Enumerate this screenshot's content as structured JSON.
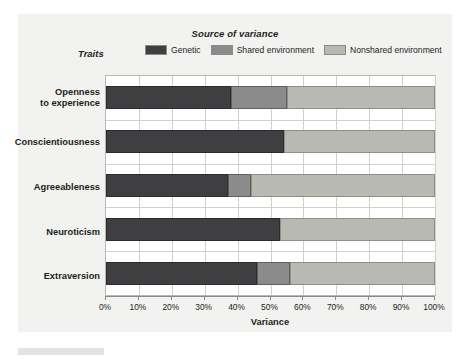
{
  "legend": {
    "title": "Source of variance",
    "traits_label": "Traits",
    "items": [
      {
        "label": "Genetic",
        "color": "#3f3f42",
        "swatch_name": "legend-swatch-genetic"
      },
      {
        "label": "Shared environment",
        "color": "#8b8b8c",
        "swatch_name": "legend-swatch-shared-environment"
      },
      {
        "label": "Nonshared environment",
        "color": "#b9b9b4",
        "swatch_name": "legend-swatch-nonshared-environment"
      }
    ]
  },
  "axis": {
    "x_title": "Variance",
    "ticks": [
      "0%",
      "10%",
      "20%",
      "30%",
      "40%",
      "50%",
      "60%",
      "70%",
      "80%",
      "90%",
      "100%"
    ]
  },
  "traits": [
    {
      "line1": "Openness",
      "line2": "to experience"
    },
    {
      "line1": "Conscientiousness",
      "line2": ""
    },
    {
      "line1": "Agreeableness",
      "line2": ""
    },
    {
      "line1": "Neuroticism",
      "line2": ""
    },
    {
      "line1": "Extraversion",
      "line2": ""
    }
  ],
  "chart_data": {
    "type": "bar",
    "orientation": "horizontal",
    "stacked": true,
    "title": "Source of variance",
    "xlabel": "Variance",
    "ylabel": "Traits",
    "xlim": [
      0,
      100
    ],
    "xticks": [
      0,
      10,
      20,
      30,
      40,
      50,
      60,
      70,
      80,
      90,
      100
    ],
    "xtick_labels": [
      "0%",
      "10%",
      "20%",
      "30%",
      "40%",
      "50%",
      "60%",
      "70%",
      "80%",
      "90%",
      "100%"
    ],
    "grid": true,
    "legend_position": "top",
    "categories": [
      "Openness to experience",
      "Conscientiousness",
      "Agreeableness",
      "Neuroticism",
      "Extraversion"
    ],
    "series": [
      {
        "name": "Genetic",
        "color": "#3f3f42",
        "values": [
          38,
          54,
          37,
          53,
          46
        ]
      },
      {
        "name": "Shared environment",
        "color": "#8b8b8c",
        "values": [
          17,
          0,
          7,
          0,
          10
        ]
      },
      {
        "name": "Nonshared environment",
        "color": "#b9b9b4",
        "values": [
          45,
          46,
          56,
          47,
          44
        ]
      }
    ]
  }
}
